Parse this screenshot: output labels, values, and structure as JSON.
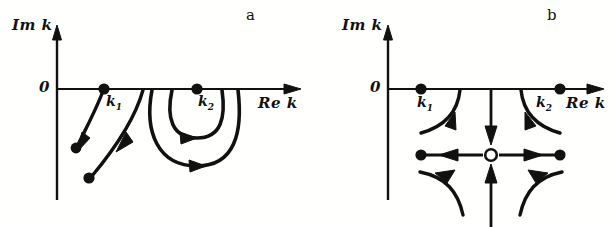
{
  "figure": {
    "kind": "complex-plane-pole-trajectory-diagram",
    "background_color": "#fffffe",
    "ink_color": "#111111",
    "panel_count": 2
  },
  "panels": [
    {
      "id": "a",
      "letter": "a",
      "axes": {
        "vertical_label": "Im k",
        "horizontal_label": "Re k",
        "origin_label": "0",
        "origin_px": {
          "x": 57,
          "y": 89
        },
        "vertical_arrow_tip_px": {
          "x": 57,
          "y": 28
        },
        "horizontal_arrow_tip_px": {
          "x": 300,
          "y": 89
        }
      },
      "marked_points": [
        {
          "name": "k1",
          "label": "k",
          "subscript": "1",
          "style": "filled",
          "on_axis": true,
          "px": {
            "x": 104,
            "y": 89
          }
        },
        {
          "name": "k2",
          "label": "k",
          "subscript": "2",
          "style": "filled",
          "on_axis": true,
          "px": {
            "x": 197,
            "y": 89
          }
        }
      ],
      "trajectories": [
        {
          "name": "branch-from-k1",
          "shape": "descending-arc",
          "arrow": "down-left",
          "start_on_axis": true,
          "end_style": "filled-dot"
        },
        {
          "name": "branch-right-of-k1",
          "shape": "descending-arc",
          "arrow": "down-left",
          "start_on_axis": true,
          "end_style": "filled-dot"
        },
        {
          "name": "inner-u-loop-under-k2",
          "shape": "nested-u",
          "arrow": "rightward-at-bottom",
          "start_on_axis": true,
          "end_style": "open-end-on-axis"
        },
        {
          "name": "outer-u-loop-under-k2",
          "shape": "nested-u",
          "arrow": "rightward-at-bottom",
          "start_on_axis": true,
          "end_style": "open-end-on-axis"
        }
      ]
    },
    {
      "id": "b",
      "letter": "b",
      "axes": {
        "vertical_label": "Im k",
        "horizontal_label": "Re k",
        "origin_label": "0",
        "origin_px": {
          "x": 80,
          "y": 89
        },
        "vertical_arrow_tip_px": {
          "x": 80,
          "y": 28
        },
        "horizontal_arrow_tip_px": {
          "x": 295,
          "y": 89
        }
      },
      "marked_points": [
        {
          "name": "k1",
          "label": "k",
          "subscript": "1",
          "style": "filled",
          "on_axis": true,
          "px": {
            "x": 113,
            "y": 89
          }
        },
        {
          "name": "k2",
          "label": "k",
          "subscript": "2",
          "style": "filled",
          "on_axis": true,
          "px": {
            "x": 252,
            "y": 89
          }
        },
        {
          "name": "saddle-center",
          "label": "",
          "subscript": "",
          "style": "open",
          "on_axis": false,
          "px": {
            "x": 183,
            "y": 155
          }
        },
        {
          "name": "left-fixed-point",
          "label": "",
          "subscript": "",
          "style": "filled",
          "on_axis": false,
          "px": {
            "x": 113,
            "y": 155
          }
        },
        {
          "name": "right-fixed-point",
          "label": "",
          "subscript": "",
          "style": "filled",
          "on_axis": false,
          "px": {
            "x": 252,
            "y": 155
          }
        }
      ],
      "trajectories": [
        {
          "name": "arc-from-right-of-k1",
          "shape": "concave-arc",
          "arrow": "down-left",
          "start_on_axis": true,
          "end_style": "open-end"
        },
        {
          "name": "arc-from-left-of-k2",
          "shape": "concave-arc",
          "arrow": "down-right",
          "start_on_axis": true,
          "end_style": "open-end"
        },
        {
          "name": "vertical-inflow-from-axis",
          "shape": "straight-vertical",
          "arrow": "downward",
          "start_on_axis": true,
          "end_style": "arrow-at-saddle"
        },
        {
          "name": "vertical-inflow-from-below",
          "shape": "straight-vertical",
          "arrow": "upward",
          "start_on_axis": false,
          "end_style": "arrow-at-saddle"
        },
        {
          "name": "horizontal-outflow-left",
          "shape": "straight-horizontal",
          "arrow": "leftward",
          "start_on_axis": false,
          "end_style": "filled-dot"
        },
        {
          "name": "horizontal-outflow-right",
          "shape": "straight-horizontal",
          "arrow": "rightward",
          "start_on_axis": false,
          "end_style": "filled-dot"
        },
        {
          "name": "lower-left-hyperbolic-arc",
          "shape": "hyperbolic-arc",
          "arrow": "up-left",
          "start_on_axis": false,
          "end_style": "open-end"
        },
        {
          "name": "lower-right-hyperbolic-arc",
          "shape": "hyperbolic-arc",
          "arrow": "up-right",
          "start_on_axis": false,
          "end_style": "open-end"
        }
      ]
    }
  ]
}
